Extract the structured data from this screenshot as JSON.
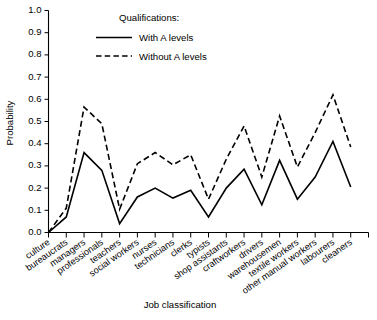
{
  "chart_data": {
    "type": "line",
    "title": "",
    "xlabel": "Job classification",
    "ylabel": "Probability",
    "ylim": [
      0.0,
      1.0
    ],
    "ytick_labels": [
      "0.0",
      "0.1",
      "0.2",
      "0.3",
      "0.4",
      "0.5",
      "0.6",
      "0.7",
      "0.8",
      "0.9",
      "1.0"
    ],
    "ytick_values": [
      0.0,
      0.1,
      0.2,
      0.3,
      0.4,
      0.5,
      0.6,
      0.7,
      0.8,
      0.9,
      1.0
    ],
    "grid": false,
    "legend_position": "top-center",
    "legend_title": "Qualifications:",
    "categories": [
      "culture",
      "bureaucrats",
      "managers",
      "professionals",
      "teachers",
      "social workers",
      "nurses",
      "technicians",
      "clerks",
      "typists",
      "shop assistants",
      "craftworkers",
      "drivers",
      "warehousemen",
      "textile workers",
      "other manual workers",
      "labourers",
      "cleaners"
    ],
    "series": [
      {
        "name": "With A levels",
        "style": "solid",
        "values": [
          0.0,
          0.07,
          0.36,
          0.28,
          0.04,
          0.16,
          0.2,
          0.155,
          0.19,
          0.07,
          0.2,
          0.285,
          0.125,
          0.325,
          0.15,
          0.25,
          0.41,
          0.205
        ]
      },
      {
        "name": "Without A levels",
        "style": "dashed",
        "values": [
          0.0,
          0.11,
          0.565,
          0.49,
          0.105,
          0.31,
          0.36,
          0.305,
          0.35,
          0.15,
          0.33,
          0.48,
          0.25,
          0.525,
          0.295,
          0.45,
          0.62,
          0.385
        ]
      }
    ]
  },
  "legend": {
    "title": "Qualifications:",
    "entries": [
      {
        "label": "With A levels",
        "style": "solid"
      },
      {
        "label": "Without A levels",
        "style": "dashed"
      }
    ]
  }
}
